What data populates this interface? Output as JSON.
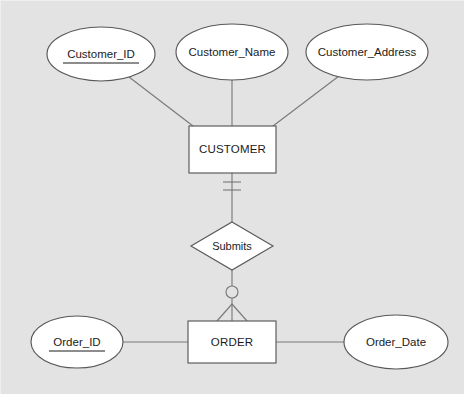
{
  "diagram": {
    "type": "entity-relationship-diagram",
    "notation": "crow's foot",
    "background_color": "#e3e3e3",
    "shape_fill_color": "#ffffff",
    "shape_stroke_color": "#58585a",
    "line_color": "#7a7a7c",
    "text_color": "#1b1b1b",
    "entities": [
      {
        "id": "customer",
        "label": "CUSTOMER",
        "shape": "rectangle",
        "x": 188,
        "y": 125,
        "width": 87,
        "height": 47
      },
      {
        "id": "order",
        "label": "ORDER",
        "shape": "rectangle",
        "x": 187,
        "y": 320,
        "width": 88,
        "height": 42
      }
    ],
    "attributes": [
      {
        "id": "customer_id",
        "label": "Customer_ID",
        "shape": "ellipse",
        "primary_key": true,
        "underlined": true,
        "belongs_to": "customer",
        "cx": 100,
        "cy": 53,
        "rx": 54,
        "ry": 27
      },
      {
        "id": "customer_name",
        "label": "Customer_Name",
        "shape": "ellipse",
        "primary_key": false,
        "underlined": false,
        "belongs_to": "customer",
        "cx": 231,
        "cy": 51,
        "rx": 56,
        "ry": 28
      },
      {
        "id": "customer_address",
        "label": "Customer_Address",
        "shape": "ellipse",
        "primary_key": false,
        "underlined": false,
        "belongs_to": "customer",
        "cx": 366,
        "cy": 51,
        "rx": 61,
        "ry": 28
      },
      {
        "id": "order_id",
        "label": "Order_ID",
        "shape": "ellipse",
        "primary_key": true,
        "underlined": true,
        "belongs_to": "order",
        "cx": 76,
        "cy": 341,
        "rx": 46,
        "ry": 26
      },
      {
        "id": "order_date",
        "label": "Order_Date",
        "shape": "ellipse",
        "primary_key": false,
        "underlined": false,
        "belongs_to": "order",
        "cx": 395,
        "cy": 341,
        "rx": 52,
        "ry": 27
      }
    ],
    "relationships": [
      {
        "id": "submits",
        "label": "Submits",
        "shape": "diamond",
        "from": "customer",
        "to": "order",
        "cx": 231,
        "cy": 245,
        "rx": 41,
        "ry": 24,
        "from_cardinality": "exactly-one",
        "from_cardinality_symbol": "double-tick",
        "to_cardinality": "zero-or-many",
        "to_cardinality_symbol": "circle-crowsfoot"
      }
    ],
    "connectors": [
      {
        "id": "customer_id-to-customer",
        "from": "customer_id",
        "to": "customer"
      },
      {
        "id": "customer_name-to-customer",
        "from": "customer_name",
        "to": "customer"
      },
      {
        "id": "customer_address-to-customer",
        "from": "customer_address",
        "to": "customer"
      },
      {
        "id": "customer-to-submits",
        "from": "customer",
        "to": "submits"
      },
      {
        "id": "submits-to-order",
        "from": "submits",
        "to": "order"
      },
      {
        "id": "order_id-to-order",
        "from": "order_id",
        "to": "order"
      },
      {
        "id": "order-to-order_date",
        "from": "order",
        "to": "order_date"
      }
    ]
  }
}
